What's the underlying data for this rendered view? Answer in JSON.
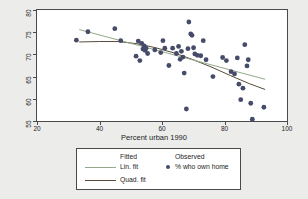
{
  "chart_data": {
    "type": "scatter",
    "title": "",
    "xlabel": "Percent urban 1990",
    "ylabel": "",
    "xlim": [
      20,
      100
    ],
    "ylim": [
      55,
      80
    ],
    "xticks": [
      20,
      40,
      60,
      80,
      100
    ],
    "yticks": [
      55,
      60,
      65,
      70,
      75,
      80
    ],
    "grid": false,
    "legend_position": "below-axis",
    "legend": {
      "fitted_header": "Fitted",
      "observed_header": "Observed",
      "lin_fit_label": "Lin. fit",
      "quad_fit_label": "Quad. fit",
      "observed_label": "% who own home"
    },
    "series": [
      {
        "name": "% who own home",
        "type": "scatter",
        "marker_color": "#464b69",
        "points": [
          [
            32.6,
            73.2
          ],
          [
            36.3,
            75.1
          ],
          [
            44.9,
            75.8
          ],
          [
            46.8,
            73.1
          ],
          [
            51.7,
            69.6
          ],
          [
            52.4,
            73.0
          ],
          [
            52.9,
            68.6
          ],
          [
            53.5,
            72.5
          ],
          [
            53.9,
            71.2
          ],
          [
            54.3,
            71.9
          ],
          [
            54.6,
            70.9
          ],
          [
            54.9,
            71.4
          ],
          [
            55.4,
            70.2
          ],
          [
            57.7,
            71.0
          ],
          [
            59.6,
            70.4
          ],
          [
            60.3,
            73.1
          ],
          [
            60.9,
            71.4
          ],
          [
            62.2,
            67.5
          ],
          [
            63.4,
            71.4
          ],
          [
            64.6,
            70.2
          ],
          [
            65.3,
            71.8
          ],
          [
            65.8,
            68.9
          ],
          [
            66.2,
            70.7
          ],
          [
            66.7,
            69.4
          ],
          [
            67.1,
            65.8
          ],
          [
            67.8,
            57.7
          ],
          [
            68.3,
            71.3
          ],
          [
            68.6,
            77.3
          ],
          [
            69.2,
            74.6
          ],
          [
            69.6,
            74.3
          ],
          [
            70.1,
            71.5
          ],
          [
            70.5,
            70.1
          ],
          [
            71.3,
            69.8
          ],
          [
            72.4,
            69.7
          ],
          [
            73.2,
            73.1
          ],
          [
            74.1,
            68.8
          ],
          [
            76.3,
            65.0
          ],
          [
            79.4,
            69.3
          ],
          [
            80.6,
            68.6
          ],
          [
            82.1,
            66.1
          ],
          [
            83.2,
            65.6
          ],
          [
            84.1,
            69.2
          ],
          [
            84.6,
            63.3
          ],
          [
            85.2,
            59.8
          ],
          [
            85.9,
            62.4
          ],
          [
            86.5,
            72.2
          ],
          [
            87.2,
            67.4
          ],
          [
            87.6,
            68.8
          ],
          [
            88.4,
            59.0
          ],
          [
            88.9,
            55.4
          ],
          [
            92.6,
            58.1
          ]
        ]
      },
      {
        "name": "Lin. fit",
        "type": "line",
        "color": "#93a98a",
        "endpoints": [
          [
            33.5,
            75.6
          ],
          [
            93.0,
            64.4
          ]
        ]
      },
      {
        "name": "Quad. fit",
        "type": "line",
        "color": "#5a4a3a",
        "curve": [
          [
            33.5,
            72.8
          ],
          [
            40.0,
            72.9
          ],
          [
            46.0,
            72.9
          ],
          [
            52.0,
            72.4
          ],
          [
            58.0,
            71.5
          ],
          [
            64.0,
            70.3
          ],
          [
            70.0,
            68.8
          ],
          [
            76.0,
            67.1
          ],
          [
            82.0,
            65.2
          ],
          [
            88.0,
            63.4
          ],
          [
            93.0,
            62.1
          ]
        ]
      }
    ]
  }
}
